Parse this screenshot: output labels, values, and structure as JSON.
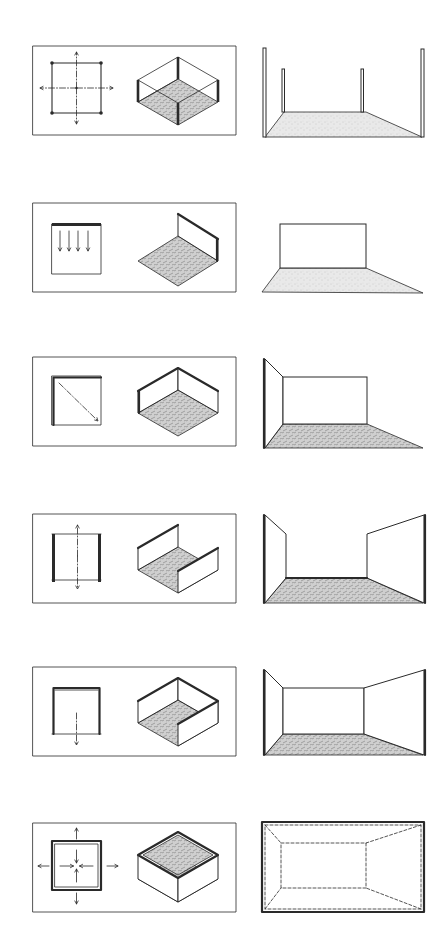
{
  "colors": {
    "ink": "#2a2a2a",
    "paper": "#ffffff",
    "floor_tone": "#9a9a9a"
  },
  "rows": [
    {
      "id": "columns",
      "label": "Four columns at corners",
      "plan": "columns",
      "iso": "columns",
      "scene": "columns"
    },
    {
      "id": "single-plane",
      "label": "Single vertical plane",
      "plan": "single-plane",
      "iso": "single-plane",
      "scene": "single-plane"
    },
    {
      "id": "l-shaped",
      "label": "L-shaped planes",
      "plan": "l-shaped",
      "iso": "l-shaped",
      "scene": "l-shaped"
    },
    {
      "id": "parallel",
      "label": "Parallel planes",
      "plan": "parallel",
      "iso": "parallel",
      "scene": "parallel"
    },
    {
      "id": "u-shaped",
      "label": "U-shaped planes",
      "plan": "u-shaped",
      "iso": "u-shaped",
      "scene": "u-shaped"
    },
    {
      "id": "closure",
      "label": "Four planes: closure",
      "plan": "closure",
      "iso": "closure",
      "scene": "closure"
    }
  ]
}
